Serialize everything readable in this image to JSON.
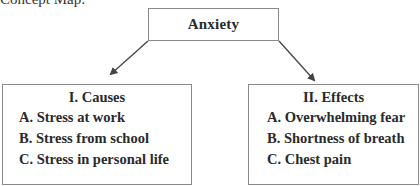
{
  "caption": "Concept Map:",
  "root": {
    "label": "Anxiety"
  },
  "branches": [
    {
      "title": "I. Causes",
      "items": [
        "A. Stress at work",
        "B. Stress from school",
        "C. Stress in personal life"
      ]
    },
    {
      "title": "II. Effects",
      "items": [
        "A. Overwhelming fear",
        "B. Shortness of breath",
        "C. Chest pain"
      ]
    }
  ],
  "colors": {
    "border": "#8a8a8a",
    "arrow": "#444444",
    "text": "#2a2a2a"
  }
}
